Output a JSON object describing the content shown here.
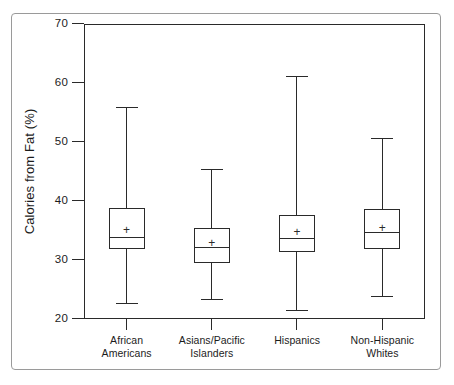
{
  "figure": {
    "kind": "box-plot-figure",
    "background_color": "#ffffff",
    "line_color": "#2a2a2a",
    "frame_color": "#9a9a9a"
  },
  "chart_data": {
    "type": "box",
    "title": "",
    "subtitle": "",
    "xlabel": "",
    "ylabel": "Calories from Fat (%)",
    "ylim": [
      20,
      70
    ],
    "y_ticks": [
      20,
      30,
      40,
      50,
      60,
      70
    ],
    "y_tick_labels": [
      "20",
      "30",
      "40",
      "50",
      "60",
      "70"
    ],
    "grid": false,
    "legend": null,
    "legend_position": "none",
    "categories": [
      "African\nAmericans",
      "Asians/Pacific\nIslanders",
      "Hispanics",
      "Non-Hispanic\nWhites"
    ],
    "category_lines": [
      [
        "African",
        "Americans"
      ],
      [
        "Asians/Pacific",
        "Islanders"
      ],
      [
        "Hispanics"
      ],
      [
        "Non-Hispanic",
        "Whites"
      ]
    ],
    "boxes": [
      {
        "label": "African Americans",
        "whisker_low": 22.5,
        "q1": 31.9,
        "median": 33.8,
        "mean": 34.9,
        "q3": 38.8,
        "whisker_high": 55.8
      },
      {
        "label": "Asians/Pacific Islanders",
        "whisker_low": 23.3,
        "q1": 29.5,
        "median": 32.0,
        "mean": 32.7,
        "q3": 35.4,
        "whisker_high": 45.2
      },
      {
        "label": "Hispanics",
        "whisker_low": 21.3,
        "q1": 31.3,
        "median": 33.6,
        "mean": 34.5,
        "q3": 37.6,
        "whisker_high": 61.1
      },
      {
        "label": "Non-Hispanic Whites",
        "whisker_low": 23.8,
        "q1": 31.8,
        "median": 34.6,
        "mean": 35.2,
        "q3": 38.7,
        "whisker_high": 50.6
      }
    ],
    "markers": {
      "mean_symbol": "+",
      "median_symbol": "line"
    }
  }
}
